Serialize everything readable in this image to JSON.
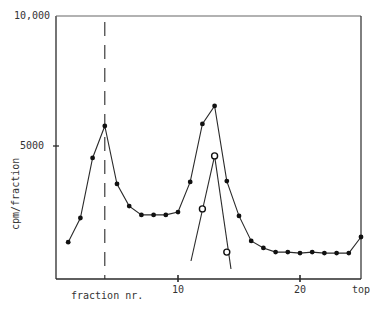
{
  "chart_data": {
    "type": "line",
    "title": "",
    "xlabel": "fraction nr.",
    "ylabel": "cpm/fraction",
    "ylim": [
      0,
      10000
    ],
    "xlim": [
      0,
      25
    ],
    "yticks": [
      "5000",
      "10,000"
    ],
    "xticks": [
      "10",
      "20",
      "top"
    ],
    "grid": false,
    "legend": null,
    "annotations": [
      "dashed vertical marker at fraction 4"
    ],
    "x": [
      1,
      2,
      3,
      4,
      5,
      6,
      7,
      8,
      9,
      10,
      11,
      12,
      13,
      14,
      15,
      16,
      17,
      18,
      19,
      20,
      21,
      22,
      23,
      24,
      25
    ],
    "series": [
      {
        "name": "filled circles",
        "marker": "filled-circle",
        "x": [
          1,
          2,
          3,
          4,
          5,
          6,
          7,
          8,
          9,
          10,
          11,
          12,
          13,
          14,
          15,
          16,
          17,
          18,
          19,
          20,
          21,
          22,
          23,
          24,
          25
        ],
        "values": [
          1300,
          2230,
          4540,
          5770,
          3540,
          2690,
          2350,
          2350,
          2350,
          2460,
          3620,
          5850,
          6540,
          3650,
          2310,
          1350,
          1080,
          920,
          920,
          880,
          920,
          880,
          880,
          880,
          1500
        ]
      },
      {
        "name": "open circles",
        "marker": "open-circle",
        "x": [
          12,
          13,
          14
        ],
        "values": [
          2580,
          4620,
          920
        ]
      }
    ]
  },
  "axes": {
    "y_tick_top": "10,000",
    "y_tick_mid": "5000",
    "y_label": "cpm/fraction",
    "x_label": "fraction nr.",
    "x_tick_10": "10",
    "x_tick_20": "20",
    "x_tick_top": "top"
  }
}
